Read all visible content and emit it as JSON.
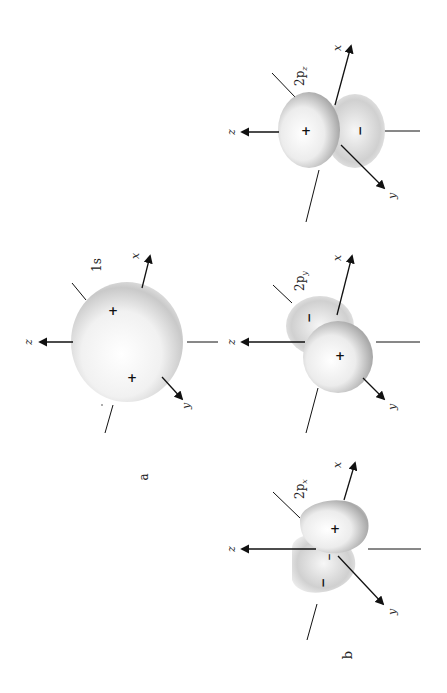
{
  "figure": {
    "panel_labels": {
      "a": "a",
      "b": "b"
    },
    "colors": {
      "axis": "#111111",
      "lobe_light": "#ffffff",
      "lobe_dark": "#8a8a8a",
      "background": "#ffffff"
    },
    "orbitals": [
      {
        "id": "1s",
        "label": "1s",
        "sub": "",
        "signs": [
          "+",
          "+"
        ],
        "axes": [
          "x",
          "y",
          "z"
        ]
      },
      {
        "id": "2py",
        "label": "2p",
        "sub": "y",
        "signs": [
          "+",
          "−"
        ],
        "axes": [
          "x",
          "y",
          "z"
        ]
      },
      {
        "id": "2pz",
        "label": "2p",
        "sub": "z",
        "signs": [
          "+",
          "−"
        ],
        "axes": [
          "x",
          "y",
          "z"
        ]
      },
      {
        "id": "2px",
        "label": "2p",
        "sub": "x",
        "signs": [
          "+",
          "−",
          "−"
        ],
        "axes": [
          "x",
          "y",
          "z"
        ]
      }
    ]
  }
}
